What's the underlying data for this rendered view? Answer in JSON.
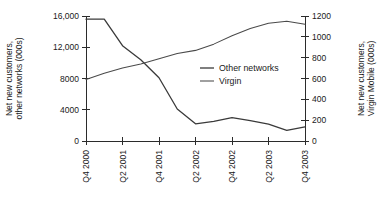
{
  "chart_data": {
    "type": "line",
    "title": "",
    "xlabel": "",
    "ylabel": "Net new customers, other networks (000s)",
    "ylabel_right": "Net new customers, Virgin Mobile (000s)",
    "grid": false,
    "legend_position": "center-right",
    "x": [
      "Q4 2000",
      "Q1 2001",
      "Q2 2001",
      "Q3 2001",
      "Q4 2001",
      "Q1 2002",
      "Q2 2002",
      "Q3 2002",
      "Q4 2002",
      "Q1 2003",
      "Q2 2003",
      "Q3 2003",
      "Q4 2003"
    ],
    "xtick_labels": [
      "Q4 2000",
      "Q2 2001",
      "Q4 2001",
      "Q2 2002",
      "Q4 2002",
      "Q2 2003",
      "Q4 2003"
    ],
    "xtick_indices": [
      0,
      2,
      4,
      6,
      8,
      10,
      12
    ],
    "left_axis": {
      "label": "Net new customers, other networks (000s)",
      "ticks": [
        "0",
        "4000",
        "8000",
        "12,000",
        "16,000"
      ],
      "tick_values": [
        0,
        4000,
        8000,
        12000,
        16000
      ],
      "ylim": [
        0,
        16000
      ],
      "series_name": "Other networks"
    },
    "right_axis": {
      "label": "Net new customers, Virgin Mobile (000s)",
      "ticks": [
        "0",
        "200",
        "400",
        "600",
        "800",
        "1000",
        "1200"
      ],
      "tick_values": [
        0,
        200,
        400,
        600,
        800,
        1000,
        1200
      ],
      "ylim": [
        0,
        1200
      ],
      "series_name": "Virgin"
    },
    "series": [
      {
        "name": "Other networks",
        "axis": "left",
        "color": "#3a3a3a",
        "values": [
          15600,
          15600,
          12200,
          10400,
          8100,
          4100,
          2200,
          2500,
          3000,
          2600,
          2150,
          1350,
          1800
        ]
      },
      {
        "name": "Virgin",
        "axis": "right",
        "color": "#4a4a4a",
        "values": [
          590,
          650,
          700,
          740,
          790,
          840,
          870,
          930,
          1010,
          1080,
          1130,
          1150,
          1120
        ]
      }
    ],
    "legend": [
      {
        "label": "Other networks",
        "color": "#3a3a3a"
      },
      {
        "label": "Virgin",
        "color": "#4a4a4a"
      }
    ]
  }
}
